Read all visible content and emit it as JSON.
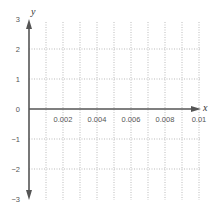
{
  "chart_data": {
    "type": "line",
    "title": "",
    "xlabel": "x",
    "ylabel": "y",
    "xlim": [
      0,
      0.01
    ],
    "ylim": [
      -3,
      3
    ],
    "x_ticks": [
      0.002,
      0.004,
      0.006,
      0.008,
      0.01
    ],
    "x_tick_labels": [
      "0.002",
      "0.004",
      "0.006",
      "0.008",
      "0.01"
    ],
    "x_minor_step": 0.001,
    "y_ticks": [
      3,
      2,
      1,
      0,
      -1,
      -2,
      -3
    ],
    "y_tick_labels": [
      "3",
      "2",
      "1",
      "0",
      "−1",
      "−2",
      "−3"
    ],
    "grid": true,
    "grid_style": "dotted",
    "series": [],
    "colors": {
      "axis": "#555555",
      "grid": "#aaaaaa",
      "text": "#555555"
    }
  }
}
